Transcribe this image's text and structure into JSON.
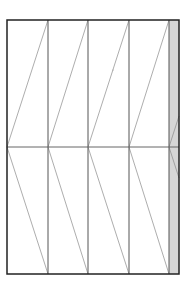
{
  "diagram": {
    "type": "panel-pattern",
    "frame": {
      "x": 7,
      "y": 20,
      "width": 172,
      "height": 254,
      "stroke": "#222222",
      "stroke_width": 1.5
    },
    "midline_y": 147,
    "columns": [
      {
        "x0": 7,
        "x1": 48
      },
      {
        "x0": 48,
        "x1": 88
      },
      {
        "x0": 88,
        "x1": 129
      },
      {
        "x0": 129,
        "x1": 169
      }
    ],
    "strip": {
      "x0": 169,
      "x1": 179,
      "fill": "#d6d6d6"
    },
    "colors": {
      "column_line": "#555555",
      "diagonal": "#8a8a8a",
      "midline": "#666666"
    },
    "speck": {
      "x": 113,
      "y": 70
    }
  }
}
